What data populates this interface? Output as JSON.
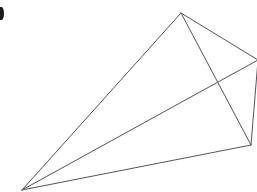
{
  "figure": {
    "type": "line-drawing",
    "canvas": {
      "width": 257,
      "height": 192,
      "background_color": "#ffffff"
    },
    "stroke": {
      "color": "#55555a",
      "width": 1,
      "style": "solid"
    },
    "vertices": [
      {
        "id": "A",
        "name": "bottom-left-vertex",
        "x": 22,
        "y": 190
      },
      {
        "id": "B",
        "name": "top-apex-vertex",
        "x": 181,
        "y": 13
      },
      {
        "id": "C",
        "name": "right-edge-vertex",
        "x": 258,
        "y": 60
      },
      {
        "id": "D",
        "name": "lower-right-vertex",
        "x": 251,
        "y": 145
      }
    ],
    "edges": [
      {
        "id": "AB",
        "name": "edge-bottomleft-to-apex",
        "from": "A",
        "to": "B"
      },
      {
        "id": "AD",
        "name": "edge-bottomleft-to-lowerright",
        "from": "A",
        "to": "D"
      },
      {
        "id": "AC",
        "name": "edge-bottomleft-to-rightedge",
        "from": "A",
        "to": "C"
      },
      {
        "id": "BC",
        "name": "edge-apex-to-rightedge",
        "from": "B",
        "to": "C"
      },
      {
        "id": "BD",
        "name": "edge-apex-to-lowerright",
        "from": "B",
        "to": "D"
      },
      {
        "id": "CD",
        "name": "edge-rightedge-to-lowerright",
        "from": "C",
        "to": "D"
      }
    ],
    "intersections": [
      {
        "name": "edge-crossing-point",
        "x": 218,
        "y": 78,
        "edges": [
          "AC",
          "BD"
        ]
      }
    ],
    "corner_artifact": {
      "name": "top-left-corner-mark",
      "color": "#1a1a1a",
      "x": 0,
      "y": 7,
      "width": 4,
      "height": 13
    }
  }
}
